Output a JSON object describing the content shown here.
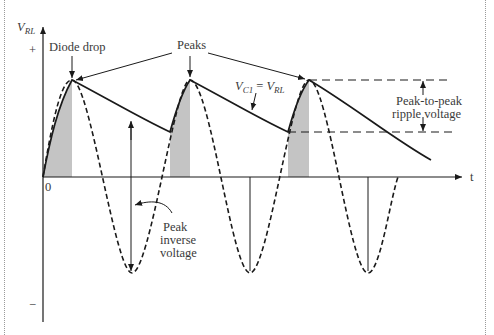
{
  "diagram": {
    "axes": {
      "y_label_main": "V",
      "y_label_sub": "RL",
      "y_plus": "+",
      "y_minus": "−",
      "x_label": "t",
      "origin": "0"
    },
    "labels": {
      "diode_drop": "Diode drop",
      "peaks": "Peaks",
      "vc1_main": "V",
      "vc1_sub": "C1",
      "vc1_eq": " = ",
      "vrl_main": "V",
      "vrl_sub": "RL",
      "ripple_line1": "Peak-to-peak",
      "ripple_line2": "ripple voltage",
      "piv_line1": "Peak",
      "piv_line2": "inverse",
      "piv_line3": "voltage"
    },
    "colors": {
      "line": "#1a1a1a",
      "shade": "#c4c4c4",
      "text": "#3a3a3a",
      "border": "#9a9a9a"
    }
  }
}
